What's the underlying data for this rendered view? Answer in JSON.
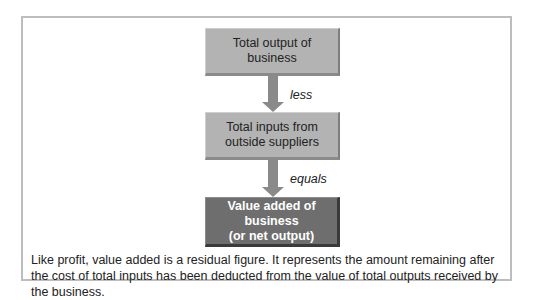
{
  "diagram": {
    "nodes": [
      {
        "id": "total-output",
        "label_line1": "Total output of",
        "label_line2": "business",
        "style": "light"
      },
      {
        "id": "total-inputs",
        "label_line1": "Total inputs from",
        "label_line2": "outside suppliers",
        "style": "light"
      },
      {
        "id": "value-added",
        "label_line1": "Value added of business",
        "label_line2": "(or net output)",
        "style": "dark"
      }
    ],
    "edges": [
      {
        "from": "total-output",
        "to": "total-inputs",
        "label": "less"
      },
      {
        "from": "total-inputs",
        "to": "value-added",
        "label": "equals"
      }
    ],
    "caption": "Like profit, value added is a residual figure. It represents the amount remaining after the cost of total inputs has been deducted from the value of total outputs received by the business."
  },
  "colors": {
    "light_box": "#b3b3b3",
    "dark_box": "#6e6e6e",
    "arrow": "#8a8a8a",
    "frame_border": "#bdbdbd"
  }
}
